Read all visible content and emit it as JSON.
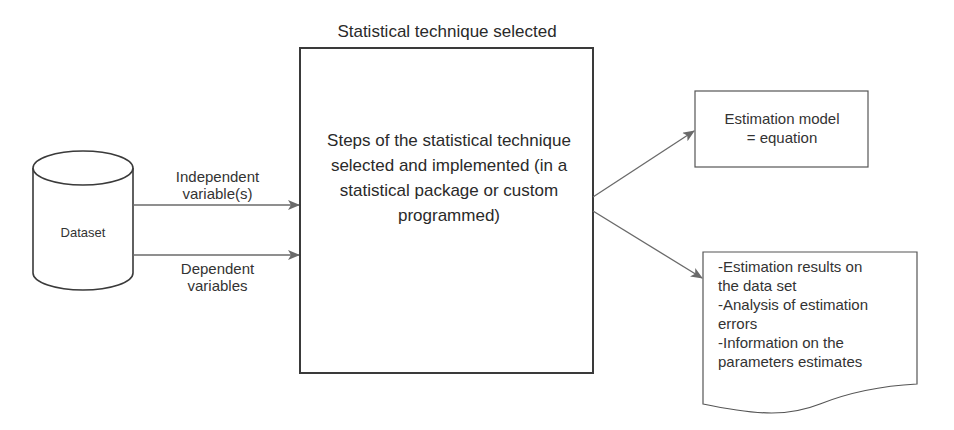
{
  "diagram": {
    "title": "Statistical technique selected",
    "dataset": {
      "label": "Dataset",
      "shape": "cylinder"
    },
    "edges": [
      {
        "from": "dataset",
        "to": "technique",
        "label": "Independent\nvariable(s)"
      },
      {
        "from": "dataset",
        "to": "technique",
        "label": "Dependent\nvariables"
      },
      {
        "from": "technique",
        "to": "model",
        "label": ""
      },
      {
        "from": "technique",
        "to": "report",
        "label": ""
      }
    ],
    "technique": {
      "label": "Steps of the statistical technique selected and implemented (in a statistical package or custom programmed)"
    },
    "model": {
      "label": "Estimation model\n= equation"
    },
    "report": {
      "shape": "document",
      "items": [
        "-Estimation results on\nthe data set",
        "-Analysis of estimation\nerrors",
        "-Information on the\nparameters estimates"
      ]
    }
  },
  "labels": {
    "independent": "Independent variable(s)",
    "dependent": "Dependent variables"
  },
  "colors": {
    "stroke": "#3a3a3a",
    "arrow": "#6a6a6a",
    "text": "#2a2a2a"
  }
}
